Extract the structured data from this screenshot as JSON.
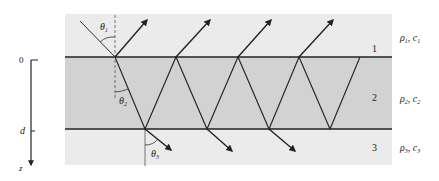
{
  "diagram": {
    "axis": {
      "label_top": "0",
      "label_mid": "d",
      "label_bottom": "z"
    },
    "layers": [
      {
        "id": "1",
        "number": "1",
        "rho": "ρ",
        "rho_sub": "1",
        "c": "c",
        "c_sub": "1",
        "color": "#ebebeb"
      },
      {
        "id": "2",
        "number": "2",
        "rho": "ρ",
        "rho_sub": "2",
        "c": "c",
        "c_sub": "2",
        "color": "#d2d2d2"
      },
      {
        "id": "3",
        "number": "3",
        "rho": "ρ",
        "rho_sub": "3",
        "c": "c",
        "c_sub": "3",
        "color": "#ebebeb"
      }
    ],
    "angles": {
      "theta1": {
        "symbol": "θ",
        "sub": "1"
      },
      "theta2": {
        "symbol": "θ",
        "sub": "2"
      },
      "theta3": {
        "symbol": "θ",
        "sub": "3"
      }
    },
    "colors": {
      "line": "#222222",
      "dashed": "#555555"
    }
  }
}
